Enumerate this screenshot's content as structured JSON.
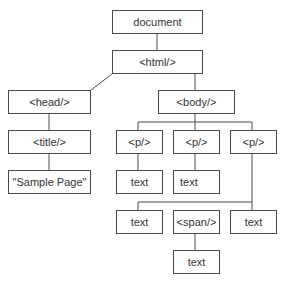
{
  "diagram": {
    "nodes": {
      "document": "document",
      "html": "<html/>",
      "head": "<head/>",
      "body": "<body/>",
      "title": "<title/>",
      "title_text": "\"Sample Page\"",
      "p1": "<p/>",
      "p2": "<p/>",
      "p3": "<p/>",
      "p1_text": "text",
      "p2_text": "text",
      "p3_text_a": "text",
      "p3_span": "<span/>",
      "p3_text_b": "text",
      "span_text": "text"
    },
    "edges": [
      [
        "document",
        "html"
      ],
      [
        "html",
        "head"
      ],
      [
        "html",
        "body"
      ],
      [
        "head",
        "title"
      ],
      [
        "title",
        "title_text"
      ],
      [
        "body",
        "p1"
      ],
      [
        "body",
        "p2"
      ],
      [
        "body",
        "p3"
      ],
      [
        "p1",
        "p1_text"
      ],
      [
        "p2",
        "p2_text"
      ],
      [
        "p3",
        "p3_text_a"
      ],
      [
        "p3",
        "p3_span"
      ],
      [
        "p3",
        "p3_text_b"
      ],
      [
        "p3_span",
        "span_text"
      ]
    ],
    "colors": {
      "stroke": "#4a4a4a",
      "text": "#333333",
      "background": "#ffffff"
    }
  }
}
